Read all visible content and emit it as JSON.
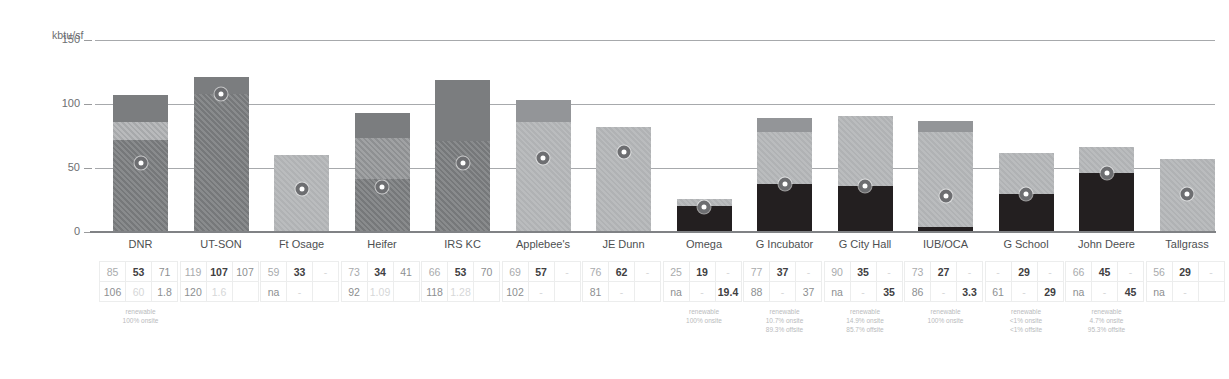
{
  "chart_data": {
    "type": "bar",
    "title": "",
    "xlabel": "",
    "ylabel": "kbtu/sf",
    "ylim": [
      0,
      150
    ],
    "yticks": [
      0,
      50,
      100,
      150
    ],
    "grid": true,
    "legend": "none",
    "categories": [
      "DNR",
      "UT-SON",
      "Ft Osage",
      "Heifer",
      "IRS KC",
      "Applebee's",
      "JE Dunn",
      "Omega",
      "G Incubator",
      "G City Hall",
      "IUB/OCA",
      "G School",
      "John Deere",
      "Tallgrass"
    ],
    "series": [
      {
        "name": "total bar height (kbtu/sf)",
        "values": [
          106,
          120,
          59,
          92,
          118,
          102,
          81,
          25,
          88,
          90,
          86,
          61,
          66,
          56
        ]
      },
      {
        "name": "marker value (kbtu/sf)",
        "values": [
          53,
          107,
          33,
          34,
          53,
          57,
          62,
          19,
          37,
          35,
          27,
          29,
          45,
          29
        ]
      }
    ],
    "bars": [
      {
        "category": "DNR",
        "total": 106,
        "segments": [
          {
            "from": 0,
            "to": 71,
            "style": "hatch-dark"
          },
          {
            "from": 71,
            "to": 85,
            "style": "hatch-light"
          },
          {
            "from": 85,
            "to": 106,
            "style": "solid-dark"
          }
        ],
        "marker": 53
      },
      {
        "category": "UT-SON",
        "total": 120,
        "segments": [
          {
            "from": 0,
            "to": 107,
            "style": "hatch-dark"
          },
          {
            "from": 107,
            "to": 120,
            "style": "solid-dark"
          }
        ],
        "marker": 107
      },
      {
        "category": "Ft Osage",
        "total": 59,
        "segments": [
          {
            "from": 0,
            "to": 59,
            "style": "solid-light"
          }
        ],
        "marker": 33
      },
      {
        "category": "Heifer",
        "total": 92,
        "segments": [
          {
            "from": 0,
            "to": 41,
            "style": "hatch-dark"
          },
          {
            "from": 41,
            "to": 73,
            "style": "hatch-mid"
          },
          {
            "from": 73,
            "to": 92,
            "style": "solid-dark"
          }
        ],
        "marker": 34
      },
      {
        "category": "IRS KC",
        "total": 118,
        "segments": [
          {
            "from": 0,
            "to": 70,
            "style": "hatch-dark"
          },
          {
            "from": 70,
            "to": 118,
            "style": "solid-dark"
          }
        ],
        "marker": 53
      },
      {
        "category": "Applebee's",
        "total": 102,
        "segments": [
          {
            "from": 0,
            "to": 85,
            "style": "solid-light"
          },
          {
            "from": 85,
            "to": 102,
            "style": "solid-mid"
          }
        ],
        "marker": 57
      },
      {
        "category": "JE Dunn",
        "total": 81,
        "segments": [
          {
            "from": 0,
            "to": 81,
            "style": "solid-light"
          }
        ],
        "marker": 62
      },
      {
        "category": "Omega",
        "total": 25,
        "segments": [
          {
            "from": 0,
            "to": 19.4,
            "style": "black"
          },
          {
            "from": 19.4,
            "to": 25,
            "style": "solid-light"
          }
        ],
        "marker": 19
      },
      {
        "category": "G Incubator",
        "total": 88,
        "segments": [
          {
            "from": 0,
            "to": 37,
            "style": "black"
          },
          {
            "from": 37,
            "to": 77,
            "style": "solid-light"
          },
          {
            "from": 77,
            "to": 88,
            "style": "solid-mid"
          }
        ],
        "marker": 37
      },
      {
        "category": "G City Hall",
        "total": 90,
        "segments": [
          {
            "from": 0,
            "to": 35,
            "style": "black"
          },
          {
            "from": 35,
            "to": 90,
            "style": "solid-light"
          }
        ],
        "marker": 35
      },
      {
        "category": "IUB/OCA",
        "total": 86,
        "segments": [
          {
            "from": 0,
            "to": 3.3,
            "style": "black"
          },
          {
            "from": 3.3,
            "to": 77,
            "style": "solid-light"
          },
          {
            "from": 77,
            "to": 86,
            "style": "solid-mid"
          }
        ],
        "marker": 27
      },
      {
        "category": "G School",
        "total": 61,
        "segments": [
          {
            "from": 0,
            "to": 29,
            "style": "black"
          },
          {
            "from": 29,
            "to": 61,
            "style": "solid-light"
          }
        ],
        "marker": 29
      },
      {
        "category": "John Deere",
        "total": 66,
        "segments": [
          {
            "from": 0,
            "to": 45,
            "style": "black"
          },
          {
            "from": 45,
            "to": 66,
            "style": "solid-light"
          }
        ],
        "marker": 45
      },
      {
        "category": "Tallgrass",
        "total": 56,
        "segments": [
          {
            "from": 0,
            "to": 56,
            "style": "solid-light"
          }
        ],
        "marker": 29
      }
    ],
    "table": {
      "groups": [
        {
          "category": "DNR",
          "row1": [
            "85",
            "53",
            "71"
          ],
          "row1_styles": [
            "v-mid",
            "v-bold",
            "v-norm"
          ],
          "row2": [
            "106",
            "60",
            "1.8"
          ],
          "row2_styles": [
            "v-norm",
            "v-blank",
            "v-norm"
          ],
          "note": [
            "renewable",
            "100% onsite"
          ]
        },
        {
          "category": "UT-SON",
          "row1": [
            "119",
            "107",
            "107"
          ],
          "row1_styles": [
            "v-mid",
            "v-bold",
            "v-norm"
          ],
          "row2": [
            "120",
            "1.6",
            ""
          ],
          "row2_styles": [
            "v-norm",
            "v-blank",
            "v-blank"
          ],
          "note": []
        },
        {
          "category": "Ft Osage",
          "row1": [
            "59",
            "33",
            "-"
          ],
          "row1_styles": [
            "v-mid",
            "v-bold",
            "v-blank"
          ],
          "row2": [
            "na",
            "-",
            ""
          ],
          "row2_styles": [
            "v-norm",
            "v-blank",
            "v-blank"
          ],
          "note": []
        },
        {
          "category": "Heifer",
          "row1": [
            "73",
            "34",
            "41"
          ],
          "row1_styles": [
            "v-mid",
            "v-bold",
            "v-norm"
          ],
          "row2": [
            "92",
            "1.09",
            ""
          ],
          "row2_styles": [
            "v-norm",
            "v-blank",
            "v-blank"
          ],
          "note": []
        },
        {
          "category": "IRS KC",
          "row1": [
            "66",
            "53",
            "70"
          ],
          "row1_styles": [
            "v-mid",
            "v-bold",
            "v-norm"
          ],
          "row2": [
            "118",
            "1.28",
            ""
          ],
          "row2_styles": [
            "v-norm",
            "v-blank",
            "v-blank"
          ],
          "note": []
        },
        {
          "category": "Applebee's",
          "row1": [
            "69",
            "57",
            "-"
          ],
          "row1_styles": [
            "v-mid",
            "v-bold",
            "v-blank"
          ],
          "row2": [
            "102",
            "-",
            ""
          ],
          "row2_styles": [
            "v-norm",
            "v-blank",
            "v-blank"
          ],
          "note": []
        },
        {
          "category": "JE Dunn",
          "row1": [
            "76",
            "62",
            "-"
          ],
          "row1_styles": [
            "v-mid",
            "v-bold",
            "v-blank"
          ],
          "row2": [
            "81",
            "-",
            ""
          ],
          "row2_styles": [
            "v-norm",
            "v-blank",
            "v-blank"
          ],
          "note": []
        },
        {
          "category": "Omega",
          "row1": [
            "25",
            "19",
            "-"
          ],
          "row1_styles": [
            "v-mid",
            "v-bold",
            "v-blank"
          ],
          "row2": [
            "na",
            "-",
            "19.4"
          ],
          "row2_styles": [
            "v-norm",
            "v-blank",
            "v-bold"
          ],
          "note": [
            "renewable",
            "100% onsite"
          ]
        },
        {
          "category": "G Incubator",
          "row1": [
            "77",
            "37",
            "-"
          ],
          "row1_styles": [
            "v-mid",
            "v-bold",
            "v-blank"
          ],
          "row2": [
            "88",
            "-",
            "37"
          ],
          "row2_styles": [
            "v-norm",
            "v-blank",
            "v-norm"
          ],
          "note": [
            "renewable",
            "10.7% onsite",
            "89.3% offsite"
          ]
        },
        {
          "category": "G City Hall",
          "row1": [
            "90",
            "35",
            "-"
          ],
          "row1_styles": [
            "v-mid",
            "v-bold",
            "v-blank"
          ],
          "row2": [
            "na",
            "-",
            "35"
          ],
          "row2_styles": [
            "v-norm",
            "v-blank",
            "v-bold"
          ],
          "note": [
            "renewable",
            "14.9% onsite",
            "85.7% offsite"
          ]
        },
        {
          "category": "IUB/OCA",
          "row1": [
            "73",
            "27",
            "-"
          ],
          "row1_styles": [
            "v-mid",
            "v-bold",
            "v-blank"
          ],
          "row2": [
            "86",
            "-",
            "3.3"
          ],
          "row2_styles": [
            "v-norm",
            "v-blank",
            "v-bold"
          ],
          "note": [
            "renewable",
            "100% onsite"
          ]
        },
        {
          "category": "G School",
          "row1": [
            "-",
            "29",
            "-"
          ],
          "row1_styles": [
            "v-blank",
            "v-bold",
            "v-blank"
          ],
          "row2": [
            "61",
            "-",
            "29"
          ],
          "row2_styles": [
            "v-norm",
            "v-blank",
            "v-bold"
          ],
          "note": [
            "renewable",
            "<1% onsite",
            "<1% offsite"
          ]
        },
        {
          "category": "John Deere",
          "row1": [
            "66",
            "45",
            "-"
          ],
          "row1_styles": [
            "v-mid",
            "v-bold",
            "v-blank"
          ],
          "row2": [
            "na",
            "-",
            "45"
          ],
          "row2_styles": [
            "v-norm",
            "v-blank",
            "v-bold"
          ],
          "note": [
            "renewable",
            "4.7% onsite",
            "95.3% offsite"
          ]
        },
        {
          "category": "Tallgrass",
          "row1": [
            "56",
            "29",
            "-"
          ],
          "row1_styles": [
            "v-mid",
            "v-bold",
            "v-blank"
          ],
          "row2": [
            "na",
            "-",
            ""
          ],
          "row2_styles": [
            "v-norm",
            "v-blank",
            "v-blank"
          ],
          "note": []
        }
      ]
    },
    "colors": {
      "hatch_dark": "#76787a",
      "hatch_mid": "#8e9092",
      "hatch_light": "#a7a9ab",
      "solid_light": "#b0b2b4",
      "solid_mid": "#939598",
      "black": "#231f20",
      "gridline": "#a7a9ac",
      "text": "#58595b"
    }
  }
}
